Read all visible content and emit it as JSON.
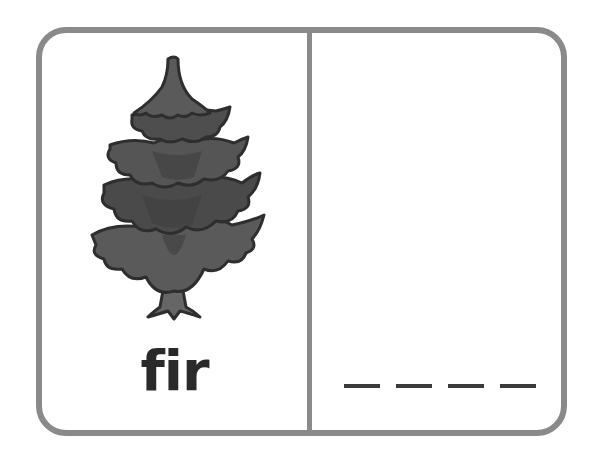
{
  "card": {
    "picture": {
      "icon": "fir-tree-icon",
      "alt": "fir tree"
    },
    "word": "fir",
    "answer_blanks": 4
  },
  "colors": {
    "border": "#8a8a8a",
    "tree_fill": "#5a5a5a",
    "tree_dark": "#3f3f3f",
    "tree_outline": "#2e2e2e",
    "text": "#2a2a2a"
  }
}
